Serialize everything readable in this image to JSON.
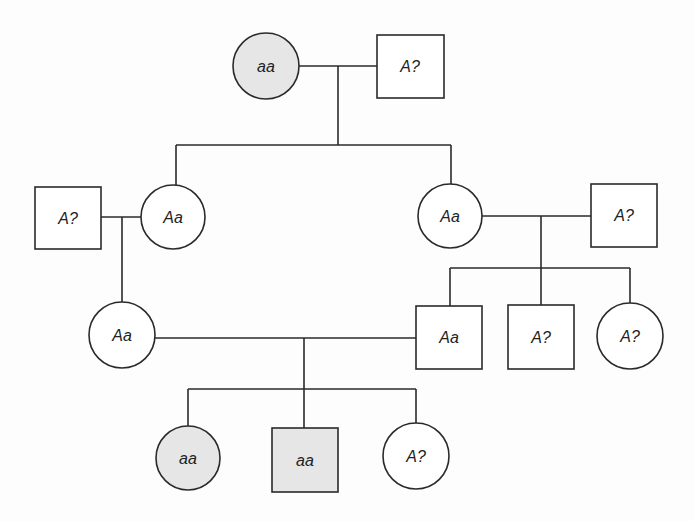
{
  "diagram": {
    "type": "pedigree",
    "colors": {
      "affected_fill": "#e6e6e6",
      "unaffected_fill": "#ffffff",
      "line": "#2a2a2a"
    },
    "individuals": [
      {
        "id": "I-1",
        "generation": 1,
        "sex": "female",
        "genotype": "aa",
        "affected": true
      },
      {
        "id": "I-2",
        "generation": 1,
        "sex": "male",
        "genotype": "A?",
        "affected": false
      },
      {
        "id": "II-1",
        "generation": 2,
        "sex": "male",
        "genotype": "A?",
        "affected": false
      },
      {
        "id": "II-2",
        "generation": 2,
        "sex": "female",
        "genotype": "Aa",
        "affected": false
      },
      {
        "id": "II-3",
        "generation": 2,
        "sex": "female",
        "genotype": "Aa",
        "affected": false
      },
      {
        "id": "II-4",
        "generation": 2,
        "sex": "male",
        "genotype": "A?",
        "affected": false
      },
      {
        "id": "III-1",
        "generation": 3,
        "sex": "female",
        "genotype": "Aa",
        "affected": false
      },
      {
        "id": "III-2",
        "generation": 3,
        "sex": "male",
        "genotype": "Aa",
        "affected": false
      },
      {
        "id": "III-3",
        "generation": 3,
        "sex": "male",
        "genotype": "A?",
        "affected": false
      },
      {
        "id": "III-4",
        "generation": 3,
        "sex": "female",
        "genotype": "A?",
        "affected": false
      },
      {
        "id": "IV-1",
        "generation": 4,
        "sex": "female",
        "genotype": "aa",
        "affected": true
      },
      {
        "id": "IV-2",
        "generation": 4,
        "sex": "male",
        "genotype": "aa",
        "affected": true
      },
      {
        "id": "IV-3",
        "generation": 4,
        "sex": "female",
        "genotype": "A?",
        "affected": false
      }
    ],
    "matings": [
      {
        "partners": [
          "I-1",
          "I-2"
        ],
        "children": [
          "II-2",
          "II-3"
        ]
      },
      {
        "partners": [
          "II-1",
          "II-2"
        ],
        "children": [
          "III-1"
        ]
      },
      {
        "partners": [
          "II-3",
          "II-4"
        ],
        "children": [
          "III-2",
          "III-3",
          "III-4"
        ]
      },
      {
        "partners": [
          "III-1",
          "III-2"
        ],
        "children": [
          "IV-1",
          "IV-2",
          "IV-3"
        ]
      }
    ]
  }
}
